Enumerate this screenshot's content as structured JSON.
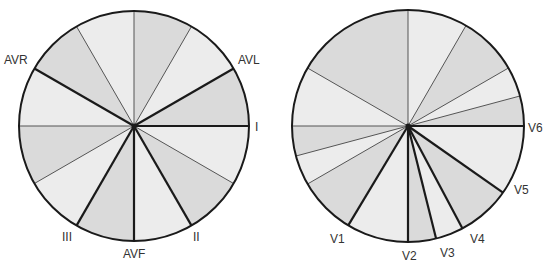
{
  "diagram": {
    "colors": {
      "light": "#ececec",
      "dark": "#dadada",
      "line": "#1a1a1a",
      "thin": "#555555"
    },
    "frontal": {
      "cx": 134,
      "cy": 126,
      "r": 115,
      "leads": [
        {
          "name": "I",
          "angle": 0,
          "lx": 255,
          "ly": 131
        },
        {
          "name": "II",
          "angle": 60,
          "lx": 193,
          "ly": 241
        },
        {
          "name": "AVF",
          "angle": 90,
          "lx": 123,
          "ly": 258
        },
        {
          "name": "III",
          "angle": 120,
          "lx": 62,
          "ly": 241
        },
        {
          "name": "AVR",
          "angle": 210,
          "lx": 4,
          "ly": 64
        },
        {
          "name": "AVL",
          "angle": 330,
          "lx": 238,
          "ly": 64
        }
      ],
      "thin_lines": [
        30,
        150,
        180,
        240,
        270,
        300
      ],
      "dark_sectors": [
        [
          30,
          60
        ],
        [
          90,
          120
        ],
        [
          150,
          180
        ],
        [
          210,
          240
        ],
        [
          270,
          300
        ],
        [
          330,
          360
        ]
      ]
    },
    "horizontal": {
      "cx": 408,
      "cy": 126,
      "r": 116,
      "leads": [
        {
          "name": "V6",
          "angle": 0,
          "lx": 528,
          "ly": 132
        },
        {
          "name": "V5",
          "angle": 35,
          "lx": 514,
          "ly": 194
        },
        {
          "name": "V4",
          "angle": 62,
          "lx": 470,
          "ly": 243
        },
        {
          "name": "V3",
          "angle": 76,
          "lx": 440,
          "ly": 257
        },
        {
          "name": "V2",
          "angle": 90,
          "lx": 402,
          "ly": 260
        },
        {
          "name": "V1",
          "angle": 121,
          "lx": 330,
          "ly": 243
        }
      ],
      "thin_lines": [
        150,
        165,
        180,
        210,
        270,
        300,
        330,
        345
      ],
      "dark_sectors": [
        [
          35,
          62
        ],
        [
          76,
          90
        ],
        [
          121,
          150
        ],
        [
          165,
          180
        ],
        [
          210,
          270
        ],
        [
          300,
          330
        ],
        [
          345,
          360
        ]
      ]
    }
  }
}
